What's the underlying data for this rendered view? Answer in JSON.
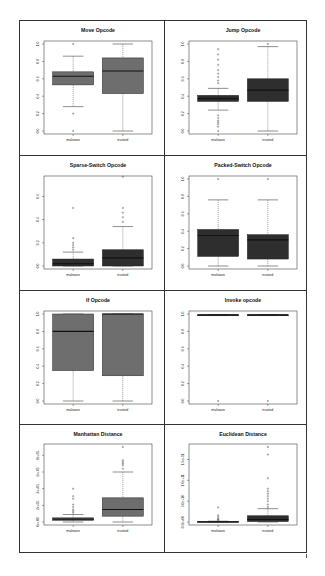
{
  "figure": {
    "groups": [
      "malware",
      "trusted"
    ],
    "box_color": "#6e6e6e",
    "dark_box_color": "#2e2e2e",
    "median_color": "#111111"
  },
  "chart_data": [
    {
      "type": "box",
      "title": "Move Opcode",
      "categories": [
        "malware",
        "trusted"
      ],
      "ylim": [
        0,
        1
      ],
      "yticks": [
        "0.0",
        "0.2",
        "0.4",
        "0.6",
        "0.8",
        "1.0"
      ],
      "fill": "#6e6e6e",
      "series": [
        {
          "name": "malware",
          "min": 0.28,
          "q1": 0.53,
          "median": 0.63,
          "q3": 0.68,
          "max": 0.86,
          "outliers": [
            1.0,
            0.2,
            0.0
          ]
        },
        {
          "name": "trusted",
          "min": 0.0,
          "q1": 0.43,
          "median": 0.69,
          "q3": 0.84,
          "max": 1.0,
          "outliers": []
        }
      ]
    },
    {
      "type": "box",
      "title": "Jump Opcode",
      "categories": [
        "malware",
        "trusted"
      ],
      "ylim": [
        0,
        1
      ],
      "yticks": [
        "0.0",
        "0.2",
        "0.4",
        "0.6",
        "0.8",
        "1.0"
      ],
      "fill": "#2e2e2e",
      "series": [
        {
          "name": "malware",
          "min": 0.24,
          "q1": 0.34,
          "median": 0.37,
          "q3": 0.41,
          "max": 0.49,
          "outliers": [
            0.0,
            0.05,
            0.08,
            0.1,
            0.12,
            0.15,
            0.18,
            0.55,
            0.58,
            0.62,
            0.66,
            0.7,
            0.76,
            0.82,
            0.88,
            0.94
          ]
        },
        {
          "name": "trusted",
          "min": 0.0,
          "q1": 0.34,
          "median": 0.47,
          "q3": 0.6,
          "max": 0.97,
          "outliers": [
            1.0
          ]
        }
      ]
    },
    {
      "type": "box",
      "title": "Sparse-Switch Opcode",
      "categories": [
        "malware",
        "trusted"
      ],
      "ylim": [
        0,
        0.75
      ],
      "yticks": [
        "0.0",
        "0.2",
        "0.4",
        "0.6"
      ],
      "fill": "#2e2e2e",
      "series": [
        {
          "name": "malware",
          "min": 0.0,
          "q1": 0.0,
          "median": 0.02,
          "q3": 0.06,
          "max": 0.12,
          "outliers": [
            0.14,
            0.16,
            0.18,
            0.2,
            0.24,
            0.5
          ]
        },
        {
          "name": "trusted",
          "min": 0.0,
          "q1": 0.0,
          "median": 0.07,
          "q3": 0.14,
          "max": 0.34,
          "outliers": [
            0.38,
            0.42,
            0.46,
            0.5,
            0.77
          ]
        }
      ]
    },
    {
      "type": "box",
      "title": "Packed-Switch Opcode",
      "categories": [
        "malware",
        "trusted"
      ],
      "ylim": [
        0,
        1
      ],
      "yticks": [
        "0.0",
        "0.2",
        "0.4",
        "0.6",
        "0.8",
        "1.0"
      ],
      "fill": "#2e2e2e",
      "series": [
        {
          "name": "malware",
          "min": 0.0,
          "q1": 0.11,
          "median": 0.35,
          "q3": 0.42,
          "max": 0.76,
          "outliers": [
            1.0
          ]
        },
        {
          "name": "trusted",
          "min": 0.0,
          "q1": 0.08,
          "median": 0.3,
          "q3": 0.36,
          "max": 0.76,
          "outliers": [
            1.0
          ]
        }
      ]
    },
    {
      "type": "box",
      "title": "If Opcode",
      "categories": [
        "malware",
        "trusted"
      ],
      "ylim": [
        0,
        1
      ],
      "yticks": [
        "0.0",
        "0.2",
        "0.4",
        "0.6",
        "0.8",
        "1.0"
      ],
      "fill": "#6e6e6e",
      "series": [
        {
          "name": "malware",
          "min": 0.0,
          "q1": 0.35,
          "median": 0.8,
          "q3": 1.0,
          "max": 1.0,
          "outliers": []
        },
        {
          "name": "trusted",
          "min": 0.0,
          "q1": 0.29,
          "median": 1.0,
          "q3": 1.0,
          "max": 1.0,
          "outliers": []
        }
      ]
    },
    {
      "type": "box",
      "title": "Invoke opcode",
      "categories": [
        "malware",
        "trusted"
      ],
      "ylim": [
        0,
        1
      ],
      "yticks": [
        "0.0",
        "0.2",
        "0.4",
        "0.6",
        "0.8",
        "1.0"
      ],
      "fill": "#2e2e2e",
      "series": [
        {
          "name": "malware",
          "min": 0.99,
          "q1": 0.99,
          "median": 0.99,
          "q3": 0.99,
          "max": 0.99,
          "outliers": [
            0.0
          ]
        },
        {
          "name": "trusted",
          "min": 0.99,
          "q1": 0.99,
          "median": 0.99,
          "q3": 0.99,
          "max": 0.99,
          "outliers": [
            0.0
          ]
        }
      ]
    },
    {
      "type": "box",
      "title": "Manhattan Distance",
      "categories": [
        "malware",
        "trusted"
      ],
      "ylim": [
        0,
        900000
      ],
      "yticks": [
        "0e+00",
        "2e+05",
        "4e+05",
        "6e+05",
        "8e+05"
      ],
      "fill": "#6e6e6e",
      "series": [
        {
          "name": "malware",
          "min": 0,
          "q1": 20000,
          "median": 35000,
          "q3": 50000,
          "max": 90000,
          "outliers": [
            110000,
            130000,
            150000,
            180000,
            210000,
            280000,
            310000,
            400000
          ]
        },
        {
          "name": "trusted",
          "min": 0,
          "q1": 70000,
          "median": 150000,
          "q3": 290000,
          "max": 600000,
          "outliers": [
            640000,
            680000,
            700000,
            720000,
            740000,
            900000
          ]
        }
      ]
    },
    {
      "type": "box",
      "title": "Euclidean Distance",
      "categories": [
        "malware",
        "trusted"
      ],
      "ylim": [
        0,
        180000000000
      ],
      "yticks": [
        "0.0e+00",
        "5.0e+10",
        "1.0e+11",
        "1.5e+11"
      ],
      "fill": "#2e2e2e",
      "series": [
        {
          "name": "malware",
          "min": 0,
          "q1": 0,
          "median": 500000000,
          "q3": 1000000000,
          "max": 2000000000,
          "outliers": [
            4000000000,
            6000000000,
            8000000000,
            12000000000,
            16000000000,
            35000000000
          ]
        },
        {
          "name": "trusted",
          "min": 0,
          "q1": 1000000000,
          "median": 6000000000,
          "q3": 15000000000,
          "max": 32000000000,
          "outliers": [
            36000000000,
            42000000000,
            50000000000,
            56000000000,
            62000000000,
            68000000000,
            74000000000,
            80000000000,
            105000000000,
            162000000000,
            180000000000
          ]
        }
      ]
    }
  ]
}
